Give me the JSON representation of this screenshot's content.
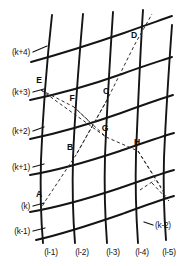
{
  "figure": {
    "background_color": "#ffffff",
    "line_color": "#141414",
    "dashed_color": "#2a2a2a",
    "width": 191,
    "height": 266
  },
  "axis_labels": {
    "left": [
      {
        "text": "(k+4)",
        "x": 30,
        "y": 55,
        "leader": {
          "x1": 33,
          "y1": 52,
          "x2": 47,
          "y2": 46
        }
      },
      {
        "text": "(k+3)",
        "x": 30,
        "y": 95,
        "leader": {
          "x1": 33,
          "y1": 92,
          "x2": 44,
          "y2": 89
        }
      },
      {
        "text": "(k+2)",
        "x": 30,
        "y": 134,
        "leader": {
          "x1": 33,
          "y1": 131,
          "x2": 44,
          "y2": 127
        }
      },
      {
        "text": "(k+1)",
        "x": 30,
        "y": 170,
        "leader": {
          "x1": 33,
          "y1": 167,
          "x2": 44,
          "y2": 164
        }
      },
      {
        "text": "(k)",
        "x": 30,
        "y": 209,
        "leader": {
          "x1": 33,
          "y1": 206,
          "x2": 44,
          "y2": 203
        }
      },
      {
        "text": "(k-1)",
        "x": 30,
        "y": 234,
        "leader": {
          "x1": 33,
          "y1": 231,
          "x2": 45,
          "y2": 228
        }
      }
    ],
    "right": [
      {
        "text": "(k-2)",
        "x": 155,
        "y": 228,
        "leader": {
          "x1": 153,
          "y1": 225,
          "x2": 144,
          "y2": 222
        }
      }
    ],
    "bottom": [
      {
        "text": "(l-1)",
        "x": 51,
        "y": 255
      },
      {
        "text": "(l-2)",
        "x": 82,
        "y": 255
      },
      {
        "text": "(l-3)",
        "x": 113,
        "y": 255
      },
      {
        "text": "(l-4)",
        "x": 142,
        "y": 255
      },
      {
        "text": "(l-5)",
        "x": 169,
        "y": 255
      }
    ]
  },
  "nodes": [
    {
      "id": "A",
      "x": 44,
      "y": 203,
      "label_dx": -5,
      "label_dy": -6
    },
    {
      "id": "B",
      "x": 76,
      "y": 155,
      "label_dx": -6,
      "label_dy": -5
    },
    {
      "id": "C",
      "x": 107,
      "y": 100,
      "label_dx": -1,
      "label_dy": -6
    },
    {
      "id": "D",
      "x": 135,
      "y": 44,
      "label_dx": -1,
      "label_dy": -6
    },
    {
      "id": "E",
      "x": 41,
      "y": 90,
      "label_dx": -2,
      "label_dy": -7
    },
    {
      "id": "F",
      "x": 74,
      "y": 107,
      "label_dx": -2,
      "label_dy": -6
    },
    {
      "id": "G",
      "x": 106,
      "y": 137,
      "label_dx": -1,
      "label_dy": -6
    },
    {
      "id": "H",
      "x": 138,
      "y": 151,
      "label_dx": -1,
      "label_dy": -6
    }
  ],
  "grid": {
    "vertical_lines": [
      "M 52 15 C 47 60, 43 110, 41 160 C 40 195, 41 220, 43 243",
      "M 83 14 C 79 60, 75 110, 73 158 C 72 194, 73 218, 75 243",
      "M 113 12 C 110 58, 107 108, 105 156 C 104 192, 105 216, 107 243",
      "M 143 10 C 140 56, 138 106, 136 154 C 135 190, 136 214, 138 243",
      "M 172 25 C 169 66, 166 112, 164 158 C 163 192, 164 214, 166 240"
    ],
    "horizontal_lines": [
      "M 31 62 C 60 54, 92 44, 124 33 C 143 26, 158 21, 172 16",
      "M 30 100 C 59 94, 91 85, 122 74 C 141 67, 157 62, 172 57",
      "M 30 139 C 59 133, 90 124, 121 113 C 140 106, 157 100, 173 95",
      "M 30 175 C 59 170, 90 161, 120 151 C 140 144, 157 138, 174 133",
      "M 30 212 C 59 207, 90 198, 120 188 C 140 181, 157 175, 174 170",
      "M 36 240 C 63 234, 93 224, 122 214 C 141 207, 157 201, 174 196"
    ]
  },
  "dashed_paths": [
    {
      "name": "diagonal-ABCD",
      "d": "M 40 211 L 44 203 L 76 155 L 107 100 L 135 44 L 152 14"
    },
    {
      "name": "diagonal-EFGH",
      "d": "M 41 90 L 74 107 L 106 137 L 138 151 L 161 187"
    },
    {
      "name": "cross-E-to-G",
      "d": "M 41 90 L 106 137"
    },
    {
      "name": "cross-C-to-B",
      "d": "M 107 100 L 76 155"
    },
    {
      "name": "cross-F-tick",
      "d": "M 74 107 L 95 127"
    },
    {
      "name": "tail-H-lower",
      "d": "M 138 151 L 166 196"
    },
    {
      "name": "tail-lower-right",
      "d": "M 152 183 L 169 201"
    },
    {
      "name": "tail-lower-left",
      "d": "M 140 190 L 155 180"
    }
  ]
}
